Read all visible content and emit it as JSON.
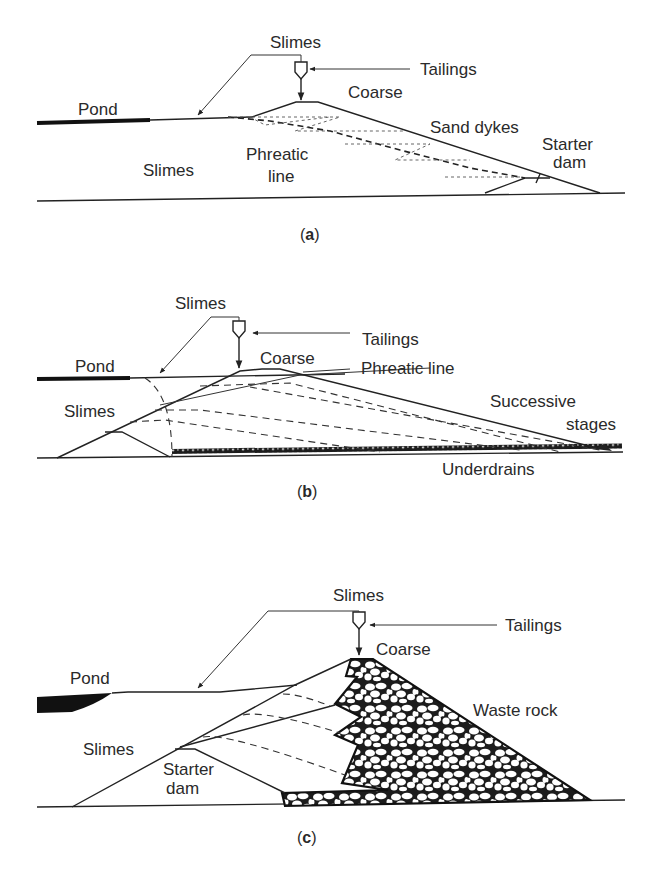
{
  "figure": {
    "panels": [
      {
        "id": "a",
        "caption": "(a)",
        "caption_letter": "a",
        "labels": {
          "slimes_top": "Slimes",
          "tailings": "Tailings",
          "pond": "Pond",
          "coarse": "Coarse",
          "sand_dykes": "Sand dykes",
          "starter": "Starter",
          "dam": "dam",
          "slimes_body": "Slimes",
          "phreatic": "Phreatic",
          "line": "line"
        }
      },
      {
        "id": "b",
        "caption": "(b)",
        "caption_letter": "b",
        "labels": {
          "slimes_top": "Slimes",
          "tailings": "Tailings",
          "pond": "Pond",
          "coarse": "Coarse",
          "phreatic_line": "Phreatic line",
          "slimes_body": "Slimes",
          "successive": "Successive",
          "stages": "stages",
          "underdrains": "Underdrains"
        }
      },
      {
        "id": "c",
        "caption": "(c)",
        "caption_letter": "c",
        "labels": {
          "slimes_top": "Slimes",
          "tailings": "Tailings",
          "pond": "Pond",
          "coarse": "Coarse",
          "waste_rock": "Waste rock",
          "slimes_body": "Slimes",
          "starter": "Starter",
          "dam": "dam"
        }
      }
    ],
    "icons": {
      "cyclone": "cyclone-separator-icon"
    },
    "colors": {
      "ink": "#222222",
      "background": "#ffffff"
    }
  }
}
